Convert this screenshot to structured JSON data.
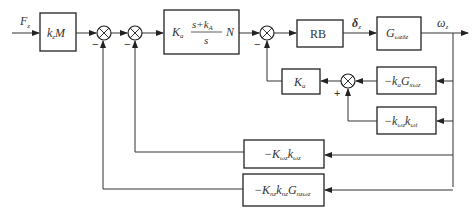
{
  "diagram": {
    "type": "control-system-block-diagram",
    "input_signal": {
      "main": "F",
      "sub": "z"
    },
    "output_signal": {
      "main": "ω",
      "sub": "z"
    },
    "intermediate_signal": {
      "main": "δ",
      "sub": "z"
    },
    "blocks": {
      "gain_km": {
        "k": "k",
        "k_sub": "z",
        "M": "M"
      },
      "controller": {
        "K": "K",
        "K_sub": "a",
        "num": "s+k",
        "num_sub": "A",
        "den": "s",
        "N": "N"
      },
      "rb": {
        "label": "RB"
      },
      "plant": {
        "G": "G",
        "sub": "ωzδz"
      },
      "inner_gain": {
        "K": "K",
        "sub": "a"
      },
      "fb_upper": {
        "prefix": "−k",
        "k_sub": "a",
        "G": "G",
        "G_sub": "xωz"
      },
      "fb_lower": {
        "prefix": "−k",
        "k_sub": "ωz",
        "k2": "k",
        "k2_sub": "ωt"
      },
      "fb_mid": {
        "prefix": "−K",
        "K_sub": "ωz",
        "k": "k",
        "k_sub": "ωz"
      },
      "fb_bottom": {
        "prefix": "−K",
        "K_sub": "nz",
        "k": "k",
        "k_sub": "nz",
        "G": "G",
        "G_sub": "nzωz"
      }
    },
    "signs": {
      "sum1": "−",
      "sum2": "−",
      "sum3": "−",
      "sum4": "+"
    },
    "colors": {
      "line": "#333333",
      "box": "#222222",
      "background": "#ffffff"
    }
  }
}
